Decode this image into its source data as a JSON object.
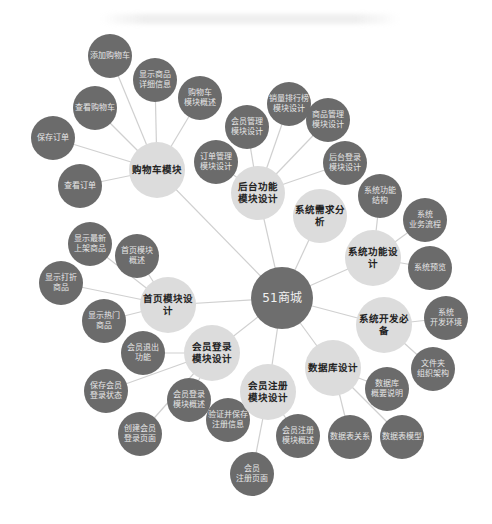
{
  "diagram": {
    "type": "mind-map",
    "colors": {
      "root": "#6e6e6e",
      "hub": "#dcdcdc",
      "leaf": "#6b6b6b",
      "link": "#d0d0d0"
    },
    "root": {
      "id": "root",
      "label": "51商城",
      "x": 282,
      "y": 298,
      "r": 31
    },
    "hubs": [
      {
        "id": "cart",
        "label": "购物车模块",
        "x": 157,
        "y": 170,
        "r": 28
      },
      {
        "id": "admin",
        "label": "后台功能\n模块设计",
        "x": 258,
        "y": 193,
        "r": 27
      },
      {
        "id": "req",
        "label": "系统需求分析",
        "x": 320,
        "y": 216,
        "r": 27
      },
      {
        "id": "func",
        "label": "系统功能设计",
        "x": 373,
        "y": 258,
        "r": 28
      },
      {
        "id": "dev",
        "label": "系统开发必备",
        "x": 384,
        "y": 325,
        "r": 28
      },
      {
        "id": "db",
        "label": "数据库设计",
        "x": 333,
        "y": 368,
        "r": 28
      },
      {
        "id": "register",
        "label": "会员注册\n模块设计",
        "x": 268,
        "y": 392,
        "r": 28
      },
      {
        "id": "login",
        "label": "会员登录\n模块设计",
        "x": 212,
        "y": 353,
        "r": 28
      },
      {
        "id": "home",
        "label": "首页模块设计",
        "x": 168,
        "y": 305,
        "r": 28
      }
    ],
    "leaves": [
      {
        "parent": "cart",
        "label": "添加购物车",
        "x": 110,
        "y": 56,
        "r": 22
      },
      {
        "parent": "cart",
        "label": "显示商品\n详细信息",
        "x": 155,
        "y": 80,
        "r": 22
      },
      {
        "parent": "cart",
        "label": "购物车\n模块概述",
        "x": 200,
        "y": 98,
        "r": 22
      },
      {
        "parent": "cart",
        "label": "查看购物车",
        "x": 95,
        "y": 108,
        "r": 22
      },
      {
        "parent": "cart",
        "label": "保存订单",
        "x": 53,
        "y": 138,
        "r": 22
      },
      {
        "parent": "cart",
        "label": "查看订单",
        "x": 80,
        "y": 186,
        "r": 22
      },
      {
        "parent": "admin",
        "label": "销量排行榜\n模块设计",
        "x": 289,
        "y": 104,
        "r": 22
      },
      {
        "parent": "admin",
        "label": "会员管理\n模块设计",
        "x": 247,
        "y": 127,
        "r": 22
      },
      {
        "parent": "admin",
        "label": "商品管理\n模块设计",
        "x": 328,
        "y": 120,
        "r": 22
      },
      {
        "parent": "admin",
        "label": "订单管理\n模块设计",
        "x": 216,
        "y": 162,
        "r": 22
      },
      {
        "parent": "admin",
        "label": "后台登录\n模块设计",
        "x": 345,
        "y": 163,
        "r": 22
      },
      {
        "parent": "func",
        "label": "系统功能\n结构",
        "x": 380,
        "y": 196,
        "r": 22
      },
      {
        "parent": "func",
        "label": "系统\n业务流程",
        "x": 425,
        "y": 220,
        "r": 22
      },
      {
        "parent": "func",
        "label": "系统预览",
        "x": 430,
        "y": 268,
        "r": 22
      },
      {
        "parent": "dev",
        "label": "系统\n开发环境",
        "x": 446,
        "y": 318,
        "r": 22
      },
      {
        "parent": "dev",
        "label": "文件夹\n组织架构",
        "x": 433,
        "y": 369,
        "r": 22
      },
      {
        "parent": "db",
        "label": "数据库\n概要说明",
        "x": 387,
        "y": 389,
        "r": 22
      },
      {
        "parent": "db",
        "label": "数据表模型",
        "x": 402,
        "y": 437,
        "r": 22
      },
      {
        "parent": "db",
        "label": "数据表关系",
        "x": 350,
        "y": 437,
        "r": 22
      },
      {
        "parent": "register",
        "label": "会员注册\n模块概述",
        "x": 298,
        "y": 436,
        "r": 22
      },
      {
        "parent": "register",
        "label": "会员\n注册页面",
        "x": 252,
        "y": 474,
        "r": 22
      },
      {
        "parent": "register",
        "label": "验证并保存\n注册信息",
        "x": 228,
        "y": 420,
        "r": 22
      },
      {
        "parent": "login",
        "label": "会员登录\n模块概述",
        "x": 189,
        "y": 400,
        "r": 22
      },
      {
        "parent": "login",
        "label": "创建会员\n登录页面",
        "x": 140,
        "y": 434,
        "r": 22
      },
      {
        "parent": "login",
        "label": "保存会员\n登录状态",
        "x": 106,
        "y": 391,
        "r": 22
      },
      {
        "parent": "login",
        "label": "会员退出\n功能",
        "x": 143,
        "y": 353,
        "r": 22
      },
      {
        "parent": "home",
        "label": "显示最新\n上架商品",
        "x": 90,
        "y": 244,
        "r": 22
      },
      {
        "parent": "home",
        "label": "首页模块\n概述",
        "x": 137,
        "y": 256,
        "r": 22
      },
      {
        "parent": "home",
        "label": "显示打折\n商品",
        "x": 61,
        "y": 283,
        "r": 22
      },
      {
        "parent": "home",
        "label": "显示热门\n商品",
        "x": 104,
        "y": 321,
        "r": 22
      }
    ]
  }
}
